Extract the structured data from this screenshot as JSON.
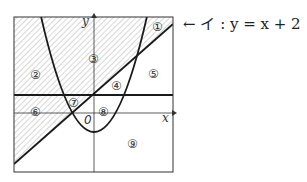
{
  "diagram": {
    "annotation": {
      "arrow": "←",
      "label": "イ : y = x + 2"
    },
    "axes": {
      "x_label": "x",
      "y_label": "y",
      "origin_label": "0"
    },
    "regions": [
      "①",
      "②",
      "③",
      "④",
      "⑤",
      "⑥",
      "⑦",
      "⑧",
      "⑨"
    ],
    "colors": {
      "line": "#1a1a1a",
      "hatch": "#9a9a9a"
    }
  }
}
